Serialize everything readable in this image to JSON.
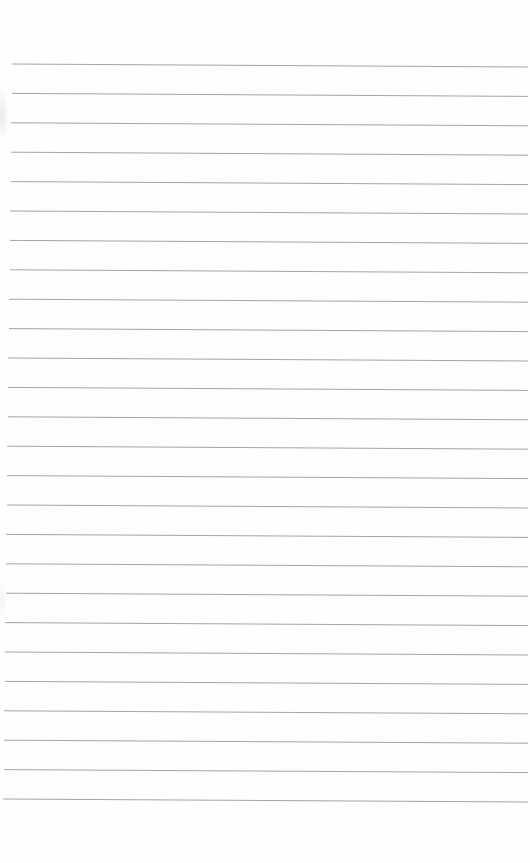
{
  "document": {
    "type": "lined-paper",
    "background_color": "#fefefe",
    "rule_color": "#9a9a9a",
    "rule_count": 26,
    "rules_left_x": 12,
    "rules_right_x": 528,
    "first_rule_y": 64,
    "rule_spacing": 29.4,
    "right_end_drop": 3
  }
}
